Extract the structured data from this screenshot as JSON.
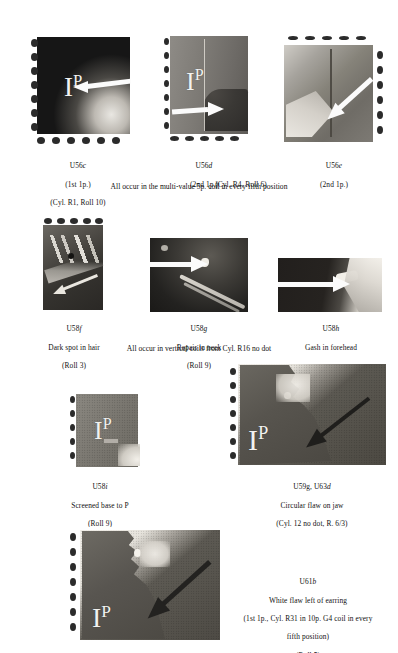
{
  "page": {
    "kind": "philatelic-reference-plate",
    "background_color": "#ffffff",
    "text_color": "#111111"
  },
  "groups": [
    {
      "id": "group-1",
      "footnote": "All occur in the multi-value 5p. coil in every fifth position",
      "items": [
        {
          "id": "u56c",
          "ref": "U56",
          "ref_suffix": "c",
          "lines": [
            "U56c",
            "(1st 1p.)",
            "(Cyl. R1, Roll 10)"
          ],
          "description": "",
          "denomination": "1P",
          "image": {
            "tone": "dark",
            "perforations": [
              "left",
              "bottom"
            ],
            "arrow": "left-pointing",
            "alt": "Dark 1p stamp detail with arrow pointing left toward flaw"
          }
        },
        {
          "id": "u56d",
          "ref": "U56",
          "ref_suffix": "d",
          "lines": [
            "U56d",
            "(2nd 1p.)",
            "(Cyl. R4, Roll 6)"
          ],
          "description": "",
          "denomination": "1P",
          "image": {
            "tone": "mid",
            "perforations": [
              "left",
              "bottom"
            ],
            "arrow": "right-pointing",
            "alt": "Mid-tone 1p stamp detail with arrow pointing right toward vertical line flaw"
          }
        },
        {
          "id": "u56e",
          "ref": "U56",
          "ref_suffix": "e",
          "lines": [
            "U56e",
            "(2nd 1p.)"
          ],
          "description": "",
          "denomination": "",
          "image": {
            "tone": "mid",
            "perforations": [
              "right",
              "top"
            ],
            "arrow": "up-left-pointing",
            "alt": "Mid-tone stamp detail with diagonal arrow toward vertical line flaw"
          }
        }
      ]
    },
    {
      "id": "group-2",
      "footnote": "All occur in vertical coils from Cyl. R16 no dot",
      "items": [
        {
          "id": "u58f",
          "ref": "U58",
          "ref_suffix": "f",
          "lines": [
            "U58f",
            "Dark spot in hair",
            "(Roll 3)"
          ],
          "description": "Dark spot in hair",
          "denomination": "",
          "image": {
            "tone": "dark",
            "perforations": [
              "top"
            ],
            "arrow": "diagonal",
            "alt": "Enlarged detail of hair and tiara with dark spot flaw"
          }
        },
        {
          "id": "u58g",
          "ref": "U58",
          "ref_suffix": "g",
          "lines": [
            "U58g",
            "Repair in neck",
            "(Roll 9)"
          ],
          "description": "Repair in neck",
          "denomination": "",
          "image": {
            "tone": "dark",
            "perforations": [],
            "arrow": "right-pointing",
            "alt": "Enlarged detail of neck and necklace with repair flaw and arrow"
          }
        },
        {
          "id": "u58h",
          "ref": "U58",
          "ref_suffix": "h",
          "lines": [
            "U58h",
            "Gash in forehead",
            "(Roll 10)"
          ],
          "description": "Gash in forehead",
          "denomination": "",
          "image": {
            "tone": "dark",
            "perforations": [],
            "arrow": "right-pointing",
            "alt": "Enlarged detail of forehead with white gash flaw and arrow"
          }
        }
      ]
    },
    {
      "id": "group-3",
      "footnote": "",
      "items": [
        {
          "id": "u58i",
          "ref": "U58",
          "ref_suffix": "i",
          "lines": [
            "U58i",
            "Screened base to P",
            "(Roll 9)",
            "(Vertical EL coil)"
          ],
          "description": "Screened base to P",
          "denomination": "1P",
          "image": {
            "tone": "mid",
            "perforations": [
              "left"
            ],
            "arrow": "none",
            "alt": "Mid-tone 1p stamp detail showing screened base to the P"
          }
        },
        {
          "id": "u59g-u63d",
          "ref": "U59g, U63",
          "ref_suffix": "d",
          "lines": [
            "U59g, U63d",
            "Circular flaw on jaw",
            "(Cyl. 12 no dot, R. 6/3)"
          ],
          "description": "Circular flaw on jaw",
          "denomination": "1P",
          "image": {
            "tone": "dark",
            "perforations": [
              "left"
            ],
            "arrow": "up-right-pointing",
            "alt": "Stamp detail of profile jaw with circular flaw and arrow"
          }
        }
      ]
    },
    {
      "id": "group-4",
      "footnote": "",
      "items": [
        {
          "id": "u61b",
          "ref": "U61",
          "ref_suffix": "b",
          "lines": [
            "U61b",
            "White flaw left of earring",
            "(1st 1p., Cyl. R31 in 10p. G4 coil in every",
            "fifth position)",
            "(Roll 5)"
          ],
          "description": "White flaw left of earring",
          "denomination": "1P",
          "image": {
            "tone": "dark",
            "perforations": [
              "left"
            ],
            "arrow": "up-right-pointing",
            "alt": "Stamp detail of profile with white flaw left of the earring and arrow"
          }
        }
      ]
    }
  ]
}
